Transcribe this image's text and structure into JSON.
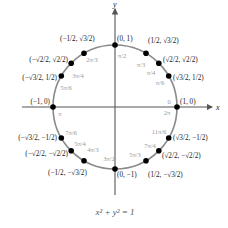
{
  "diagram": {
    "equation": "x² + y² = 1",
    "axes": {
      "x_label": "x",
      "y_label": "y"
    },
    "colors": {
      "circle": "#8a8a8a",
      "axis": "#555555",
      "point": "#000000",
      "coord_text": "#222222",
      "angle_text": "#9a9a9a"
    },
    "geometry": {
      "cx": 115,
      "cy": 107,
      "r": 62
    },
    "points": [
      {
        "deg": 0,
        "angle": "0",
        "angle2": "2π",
        "coord": "(1, 0)"
      },
      {
        "deg": 30,
        "angle": "π/6",
        "coord": "(√3/2, 1/2)"
      },
      {
        "deg": 45,
        "angle": "π/4",
        "coord": "(√2/2, √2/2)"
      },
      {
        "deg": 60,
        "angle": "π/3",
        "coord": "(1/2, √3/2)"
      },
      {
        "deg": 90,
        "angle": "π/2",
        "coord": "(0, 1)"
      },
      {
        "deg": 120,
        "angle": "2π/3",
        "coord": "(−1/2, √3/2)"
      },
      {
        "deg": 135,
        "angle": "3π/4",
        "coord": "(−√2/2, √2/2)"
      },
      {
        "deg": 150,
        "angle": "5π/6",
        "coord": "(−√3/2, 1/2)"
      },
      {
        "deg": 180,
        "angle": "π",
        "coord": "(−1, 0)"
      },
      {
        "deg": 210,
        "angle": "7π/6",
        "coord": "(−√3/2, −1/2)"
      },
      {
        "deg": 225,
        "angle": "5π/4",
        "coord": "(−√2/2, −√2/2)"
      },
      {
        "deg": 240,
        "angle": "4π/3",
        "coord": "(−1/2, −√3/2)"
      },
      {
        "deg": 270,
        "angle": "3π/2",
        "coord": "(0, −1)"
      },
      {
        "deg": 300,
        "angle": "5π/3",
        "coord": "(1/2, −√3/2)"
      },
      {
        "deg": 315,
        "angle": "7π/4",
        "coord": "(√2/2, −√2/2)"
      },
      {
        "deg": 330,
        "angle": "11π/6",
        "coord": "(√3/2, −1/2)"
      }
    ]
  }
}
